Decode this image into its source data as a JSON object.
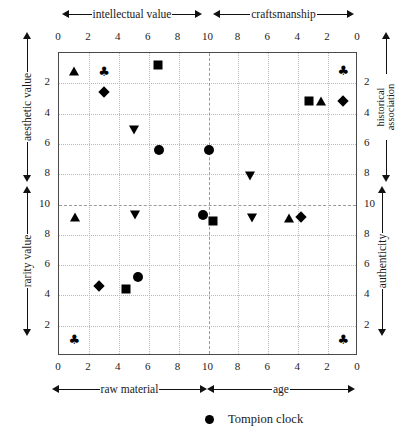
{
  "chart_data": {
    "type": "scatter",
    "title": "",
    "axis_titles": {
      "top_left": "intellectual value",
      "top_right": "craftsmanship",
      "bottom_left": "raw material",
      "bottom_right": "age",
      "left_top": "aesthetic value",
      "left_bottom": "rarity value",
      "right_top": "historical association",
      "right_bottom": "authenticity"
    },
    "axes": {
      "top": {
        "ticks": [
          "0",
          "2",
          "4",
          "6",
          "8",
          "10",
          "8",
          "6",
          "4",
          "2",
          "0"
        ],
        "range": [
          0,
          20
        ],
        "center_value": 10
      },
      "bottom": {
        "ticks": [
          "0",
          "2",
          "4",
          "6",
          "8",
          "10",
          "8",
          "6",
          "4",
          "2",
          "0"
        ],
        "range": [
          0,
          20
        ],
        "center_value": 10
      },
      "left": {
        "ticks": [
          "2",
          "4",
          "6",
          "8",
          "10",
          "8",
          "6",
          "4",
          "2"
        ],
        "range": [
          0,
          20
        ],
        "center_value": 10
      },
      "right": {
        "ticks": [
          "2",
          "4",
          "6",
          "8",
          "10",
          "8",
          "6",
          "4",
          "2"
        ],
        "range": [
          0,
          20
        ],
        "center_value": 10
      }
    },
    "grid": true,
    "legend": {
      "position": "bottom-center",
      "entries": [
        {
          "marker": "circle",
          "label": "Tompion clock"
        }
      ]
    },
    "points": [
      {
        "x": 1.0,
        "y": 1.2,
        "marker": "triangle-up",
        "quadrant": "top-left"
      },
      {
        "x": 3.0,
        "y": 1.2,
        "marker": "club",
        "quadrant": "top-left"
      },
      {
        "x": 6.6,
        "y": 0.8,
        "marker": "square",
        "quadrant": "top-left"
      },
      {
        "x": 3.0,
        "y": 2.6,
        "marker": "diamond",
        "quadrant": "top-left"
      },
      {
        "x": 5.0,
        "y": 5.1,
        "marker": "triangle-down",
        "quadrant": "top-left"
      },
      {
        "x": 6.7,
        "y": 6.4,
        "marker": "circle",
        "quadrant": "top-left"
      },
      {
        "x": 19.0,
        "y": 1.1,
        "marker": "club",
        "quadrant": "top-right"
      },
      {
        "x": 16.7,
        "y": 3.2,
        "marker": "square",
        "quadrant": "top-right"
      },
      {
        "x": 17.5,
        "y": 3.2,
        "marker": "triangle-up",
        "quadrant": "top-right"
      },
      {
        "x": 19.0,
        "y": 3.2,
        "marker": "diamond",
        "quadrant": "top-right"
      },
      {
        "x": 10.0,
        "y": 6.4,
        "marker": "circle",
        "quadrant": "center"
      },
      {
        "x": 12.8,
        "y": 8.1,
        "marker": "triangle-down",
        "quadrant": "center-right"
      },
      {
        "x": 1.1,
        "y": 10.8,
        "marker": "triangle-up",
        "quadrant": "center-left"
      },
      {
        "x": 5.1,
        "y": 10.7,
        "marker": "triangle-down",
        "quadrant": "center-left"
      },
      {
        "x": 9.6,
        "y": 10.7,
        "marker": "circle",
        "quadrant": "center"
      },
      {
        "x": 10.3,
        "y": 11.1,
        "marker": "square",
        "quadrant": "center"
      },
      {
        "x": 12.9,
        "y": 10.9,
        "marker": "triangle-down",
        "quadrant": "center-right"
      },
      {
        "x": 15.4,
        "y": 10.9,
        "marker": "triangle-up",
        "quadrant": "center-right"
      },
      {
        "x": 16.2,
        "y": 10.8,
        "marker": "diamond",
        "quadrant": "center-right"
      },
      {
        "x": 2.7,
        "y": 15.4,
        "marker": "diamond",
        "quadrant": "bottom-left"
      },
      {
        "x": 4.5,
        "y": 15.6,
        "marker": "square",
        "quadrant": "bottom-left"
      },
      {
        "x": 5.3,
        "y": 14.8,
        "marker": "circle",
        "quadrant": "bottom-left"
      },
      {
        "x": 1.0,
        "y": 18.9,
        "marker": "club",
        "quadrant": "bottom-left"
      },
      {
        "x": 19.0,
        "y": 18.9,
        "marker": "club",
        "quadrant": "bottom-right"
      }
    ]
  },
  "colors": {
    "marker": "#000000",
    "frame": "#4a4a4a",
    "grid_minor": "#b9b9b9",
    "grid_major": "#9a9a9a",
    "text": "#1a1a1a",
    "background": "#ffffff"
  }
}
